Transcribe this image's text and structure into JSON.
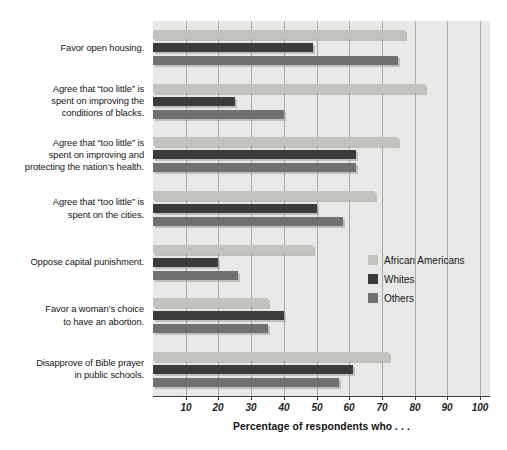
{
  "chart_data": {
    "type": "bar",
    "orientation": "horizontal",
    "title": "",
    "xlabel": "Percentage of respondents who . . .",
    "ylabel": "",
    "xlim": [
      0,
      103
    ],
    "xticks": [
      10,
      20,
      30,
      40,
      50,
      60,
      70,
      80,
      90,
      100
    ],
    "grid": true,
    "legend_position": "inside-right",
    "categories": [
      "Favor open housing.",
      "Agree that “too little” is spent on improving the conditions of blacks.",
      "Agree that “too little” is spent on improving and protecting the nation’s health.",
      "Agree that “too little” is spent on the cities.",
      "Oppose capital punishment.",
      "Favor a woman’s choice to have an abortion.",
      "Disapprove of Bible prayer in public schools."
    ],
    "series": [
      {
        "name": "African Americans",
        "color": "#c2c2bf",
        "values": [
          77,
          83,
          75,
          68,
          49,
          35,
          72
        ]
      },
      {
        "name": "Whites",
        "color": "#3b3b3b",
        "values": [
          49,
          25,
          62,
          50,
          20,
          40,
          61
        ]
      },
      {
        "name": "Others",
        "color": "#707070",
        "values": [
          75,
          40,
          62,
          58,
          26,
          35,
          57
        ]
      }
    ]
  },
  "category_labels": [
    {
      "lines": [
        "Favor open housing."
      ]
    },
    {
      "lines": [
        "Agree that “too little” is",
        "spent on improving the",
        "conditions of blacks."
      ]
    },
    {
      "lines": [
        "Agree that “too little” is",
        "spent on improving and",
        "protecting the nation’s health."
      ]
    },
    {
      "lines": [
        "Agree that “too little” is",
        "spent on the cities."
      ]
    },
    {
      "lines": [
        "Oppose capital punishment."
      ]
    },
    {
      "lines": [
        "Favor a woman’s choice",
        "to have an abortion."
      ]
    },
    {
      "lines": [
        "Disapprove of Bible prayer",
        "in public schools."
      ]
    }
  ],
  "axis": {
    "title": "Percentage of respondents who . . .",
    "tick_labels": [
      "10",
      "20",
      "30",
      "40",
      "50",
      "60",
      "70",
      "80",
      "90",
      "100"
    ]
  },
  "legend": {
    "items": [
      {
        "label": "African Americans",
        "color": "#c2c2bf",
        "swatch": "legend-swatch-african-americans"
      },
      {
        "label": "Whites",
        "color": "#3b3b3b",
        "swatch": "legend-swatch-whites"
      },
      {
        "label": "Others",
        "color": "#707070",
        "swatch": "legend-swatch-others"
      }
    ]
  },
  "colors": {
    "plot_background": "#e8e8e6",
    "gridline": "#a9a9a7",
    "axis": "#3a3a3a",
    "page_background": "#ffffff"
  }
}
